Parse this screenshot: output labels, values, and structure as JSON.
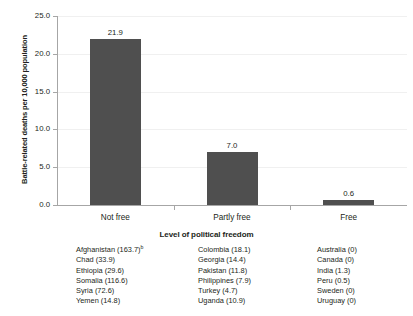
{
  "chart_data": {
    "type": "bar",
    "title": "",
    "subtitle": "",
    "categories": [
      "Not free",
      "Partly free",
      "Free"
    ],
    "values": [
      21.9,
      7.0,
      0.6
    ],
    "data_labels": [
      "21.9",
      "7.0",
      "0.6"
    ],
    "xlabel": "Level of political freedom",
    "ylabel": "Battle-related deaths per 10,000 population",
    "ylim": [
      0.0,
      25.0
    ],
    "ytick_values": [
      0.0,
      5.0,
      10.0,
      15.0,
      20.0,
      25.0
    ],
    "ytick_labels": [
      "0.0",
      "5.0",
      "10.0",
      "15.0",
      "20.0",
      "25.0"
    ],
    "grid": true,
    "legend": "none",
    "bar_color": "#4f4f4f",
    "axis_color": "#a6a6a6",
    "gridline_color": "#f0f0f0"
  },
  "footnotes": {
    "columns": [
      {
        "group": "Not free",
        "items": [
          {
            "text": "Afghanistan (163.7)",
            "sup": "b"
          },
          {
            "text": "Chad (33.9)",
            "sup": ""
          },
          {
            "text": "Ethiopia (29.6)",
            "sup": ""
          },
          {
            "text": "Somalia (116.6)",
            "sup": ""
          },
          {
            "text": "Syria (72.6)",
            "sup": ""
          },
          {
            "text": "Yemen (14.8)",
            "sup": ""
          }
        ]
      },
      {
        "group": "Partly free",
        "items": [
          {
            "text": "Colombia (18.1)",
            "sup": ""
          },
          {
            "text": "Georgia (14.4)",
            "sup": ""
          },
          {
            "text": "Pakistan (11.8)",
            "sup": ""
          },
          {
            "text": "Philippines (7.9)",
            "sup": ""
          },
          {
            "text": "Turkey (4.7)",
            "sup": ""
          },
          {
            "text": "Uganda (10.9)",
            "sup": ""
          }
        ]
      },
      {
        "group": "Free",
        "items": [
          {
            "text": "Australia (0)",
            "sup": ""
          },
          {
            "text": "Canada (0)",
            "sup": ""
          },
          {
            "text": "India (1.3)",
            "sup": ""
          },
          {
            "text": "Peru (0.5)",
            "sup": ""
          },
          {
            "text": "Sweden (0)",
            "sup": ""
          },
          {
            "text": "Uruguay (0)",
            "sup": ""
          }
        ]
      }
    ]
  }
}
